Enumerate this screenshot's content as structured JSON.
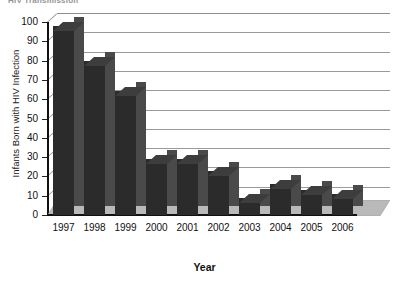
{
  "chart_data": {
    "type": "bar",
    "title": "HIV Transmission",
    "title_clipped": true,
    "xlabel": "Year",
    "ylabel": "Infants Born with HIV Infection",
    "categories": [
      "1997",
      "1998",
      "1999",
      "2000",
      "2001",
      "2002",
      "2003",
      "2004",
      "2005",
      "2006"
    ],
    "values": [
      98,
      80,
      64,
      29,
      29,
      23,
      9,
      16,
      13,
      11
    ],
    "ylim": [
      0,
      100
    ],
    "yticks": [
      0,
      10,
      20,
      30,
      40,
      50,
      60,
      70,
      80,
      90,
      100
    ],
    "grid": true,
    "legend": "none",
    "style": "3d-column",
    "colors": {
      "bar_front": "#2b2b2b",
      "bar_side": "#4a4a4a",
      "bar_top": "#3d3d3d",
      "gridline": "#9a9a9a",
      "axis": "#111111",
      "floor": "#b9b9b9",
      "background": "#ffffff"
    }
  }
}
